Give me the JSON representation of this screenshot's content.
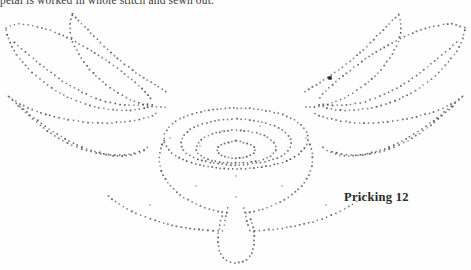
{
  "page": {
    "width": 471,
    "height": 270,
    "background_color": "#fefefe"
  },
  "caption": {
    "text": "petal is worked in whole stitch and sewn out.",
    "clipped": "true"
  },
  "figure": {
    "label": "Pricking 12",
    "dot_color": "#4a4a4a",
    "dot_size_px": 1.6
  },
  "diagram_data": {
    "type": "dotted-outline-pattern",
    "description": "Pin-prick pattern: two pairs of pointed leaf/wing shapes flanking a central concentric rose, with a narrow pendant petal below.",
    "marker_dot": {
      "x": 330,
      "y": 78,
      "note": "enlarged starting pin hole"
    },
    "paths": [
      {
        "name": "left-upper-outer-wing",
        "spacing": 4.2,
        "points": [
          [
            6,
            28
          ],
          [
            18,
            24
          ],
          [
            34,
            26
          ],
          [
            52,
            31
          ],
          [
            72,
            40
          ],
          [
            92,
            51
          ],
          [
            110,
            63
          ],
          [
            126,
            75
          ],
          [
            139,
            86
          ],
          [
            148,
            95
          ],
          [
            152,
            101
          ]
        ]
      },
      {
        "name": "left-upper-inner-wing",
        "spacing": 4.2,
        "points": [
          [
            6,
            30
          ],
          [
            9,
            40
          ],
          [
            15,
            52
          ],
          [
            26,
            66
          ],
          [
            41,
            80
          ],
          [
            58,
            92
          ],
          [
            77,
            101
          ],
          [
            96,
            107
          ],
          [
            115,
            110
          ],
          [
            133,
            110
          ],
          [
            148,
            107
          ],
          [
            155,
            103
          ]
        ]
      },
      {
        "name": "left-upper-wing-vein",
        "spacing": 4.4,
        "points": [
          [
            14,
            42
          ],
          [
            28,
            54
          ],
          [
            45,
            68
          ],
          [
            64,
            82
          ],
          [
            84,
            93
          ],
          [
            104,
            101
          ],
          [
            124,
            105
          ],
          [
            141,
            105
          ],
          [
            152,
            103
          ]
        ]
      },
      {
        "name": "left-lower-outer-wing",
        "spacing": 4.2,
        "points": [
          [
            8,
            96
          ],
          [
            20,
            104
          ],
          [
            38,
            112
          ],
          [
            60,
            118
          ],
          [
            84,
            122
          ],
          [
            108,
            123
          ],
          [
            130,
            121
          ],
          [
            148,
            117
          ],
          [
            158,
            113
          ]
        ]
      },
      {
        "name": "left-lower-inner-wing",
        "spacing": 4.3,
        "points": [
          [
            9,
            97
          ],
          [
            24,
            110
          ],
          [
            42,
            124
          ],
          [
            62,
            137
          ],
          [
            82,
            147
          ],
          [
            100,
            153
          ],
          [
            117,
            156
          ],
          [
            132,
            155
          ],
          [
            143,
            151
          ],
          [
            150,
            145
          ]
        ]
      },
      {
        "name": "left-lower-wing-vein",
        "spacing": 4.5,
        "points": [
          [
            18,
            106
          ],
          [
            34,
            120
          ],
          [
            52,
            134
          ],
          [
            72,
            145
          ],
          [
            92,
            152
          ],
          [
            112,
            155
          ],
          [
            130,
            154
          ],
          [
            143,
            150
          ]
        ]
      },
      {
        "name": "top-left-petal-outer",
        "spacing": 4.2,
        "points": [
          [
            72,
            14
          ],
          [
            80,
            22
          ],
          [
            92,
            34
          ],
          [
            106,
            48
          ],
          [
            122,
            62
          ],
          [
            138,
            74
          ],
          [
            152,
            83
          ],
          [
            162,
            89
          ],
          [
            168,
            93
          ]
        ]
      },
      {
        "name": "top-left-petal-inner",
        "spacing": 4.2,
        "points": [
          [
            72,
            15
          ],
          [
            70,
            26
          ],
          [
            72,
            40
          ],
          [
            80,
            56
          ],
          [
            92,
            72
          ],
          [
            108,
            86
          ],
          [
            125,
            97
          ],
          [
            142,
            104
          ],
          [
            156,
            107
          ],
          [
            166,
            107
          ]
        ]
      },
      {
        "name": "right-upper-outer-wing",
        "spacing": 4.2,
        "points": [
          [
            465,
            28
          ],
          [
            452,
            24
          ],
          [
            436,
            26
          ],
          [
            418,
            31
          ],
          [
            398,
            40
          ],
          [
            378,
            51
          ],
          [
            360,
            63
          ],
          [
            344,
            75
          ],
          [
            331,
            86
          ],
          [
            322,
            95
          ],
          [
            318,
            101
          ]
        ]
      },
      {
        "name": "right-upper-inner-wing",
        "spacing": 4.2,
        "points": [
          [
            465,
            30
          ],
          [
            462,
            40
          ],
          [
            456,
            52
          ],
          [
            445,
            66
          ],
          [
            430,
            80
          ],
          [
            413,
            92
          ],
          [
            394,
            101
          ],
          [
            375,
            107
          ],
          [
            356,
            110
          ],
          [
            338,
            110
          ],
          [
            323,
            107
          ],
          [
            316,
            103
          ]
        ]
      },
      {
        "name": "right-upper-wing-vein",
        "spacing": 4.4,
        "points": [
          [
            457,
            42
          ],
          [
            443,
            54
          ],
          [
            426,
            68
          ],
          [
            407,
            82
          ],
          [
            387,
            93
          ],
          [
            367,
            101
          ],
          [
            347,
            105
          ],
          [
            330,
            105
          ],
          [
            319,
            103
          ]
        ]
      },
      {
        "name": "right-lower-outer-wing",
        "spacing": 4.2,
        "points": [
          [
            463,
            96
          ],
          [
            451,
            104
          ],
          [
            433,
            112
          ],
          [
            411,
            118
          ],
          [
            387,
            122
          ],
          [
            363,
            123
          ],
          [
            341,
            121
          ],
          [
            323,
            117
          ],
          [
            313,
            113
          ]
        ]
      },
      {
        "name": "right-lower-inner-wing",
        "spacing": 4.3,
        "points": [
          [
            462,
            97
          ],
          [
            447,
            110
          ],
          [
            429,
            124
          ],
          [
            409,
            137
          ],
          [
            389,
            147
          ],
          [
            371,
            153
          ],
          [
            354,
            156
          ],
          [
            339,
            155
          ],
          [
            328,
            151
          ],
          [
            321,
            145
          ]
        ]
      },
      {
        "name": "right-lower-wing-vein",
        "spacing": 4.5,
        "points": [
          [
            453,
            106
          ],
          [
            437,
            120
          ],
          [
            419,
            134
          ],
          [
            399,
            145
          ],
          [
            379,
            152
          ],
          [
            359,
            155
          ],
          [
            341,
            154
          ],
          [
            328,
            150
          ]
        ]
      },
      {
        "name": "top-right-petal-outer",
        "spacing": 4.2,
        "points": [
          [
            399,
            14
          ],
          [
            391,
            22
          ],
          [
            379,
            34
          ],
          [
            365,
            48
          ],
          [
            349,
            62
          ],
          [
            333,
            74
          ],
          [
            319,
            83
          ],
          [
            309,
            89
          ],
          [
            303,
            93
          ]
        ]
      },
      {
        "name": "top-right-petal-inner",
        "spacing": 4.2,
        "points": [
          [
            399,
            15
          ],
          [
            401,
            26
          ],
          [
            399,
            40
          ],
          [
            391,
            56
          ],
          [
            379,
            72
          ],
          [
            363,
            86
          ],
          [
            346,
            97
          ],
          [
            329,
            104
          ],
          [
            315,
            107
          ],
          [
            305,
            107
          ]
        ]
      },
      {
        "name": "rose-outer-ring",
        "spacing": 4.0,
        "closed": true,
        "points": [
          [
            236,
            108
          ],
          [
            262,
            110
          ],
          [
            286,
            116
          ],
          [
            302,
            126
          ],
          [
            308,
            138
          ],
          [
            302,
            151
          ],
          [
            286,
            161
          ],
          [
            262,
            167
          ],
          [
            236,
            169
          ],
          [
            210,
            167
          ],
          [
            186,
            161
          ],
          [
            170,
            151
          ],
          [
            164,
            138
          ],
          [
            170,
            126
          ],
          [
            186,
            116
          ],
          [
            210,
            110
          ]
        ]
      },
      {
        "name": "rose-second-ring",
        "spacing": 3.9,
        "closed": true,
        "points": [
          [
            236,
            119
          ],
          [
            257,
            121
          ],
          [
            275,
            126
          ],
          [
            287,
            134
          ],
          [
            291,
            143
          ],
          [
            287,
            152
          ],
          [
            275,
            159
          ],
          [
            257,
            163
          ],
          [
            236,
            165
          ],
          [
            215,
            163
          ],
          [
            197,
            159
          ],
          [
            185,
            152
          ],
          [
            181,
            143
          ],
          [
            185,
            134
          ],
          [
            197,
            126
          ],
          [
            215,
            121
          ]
        ]
      },
      {
        "name": "rose-third-ring",
        "spacing": 3.8,
        "closed": true,
        "points": [
          [
            236,
            130
          ],
          [
            252,
            132
          ],
          [
            265,
            136
          ],
          [
            273,
            142
          ],
          [
            276,
            148
          ],
          [
            273,
            154
          ],
          [
            265,
            159
          ],
          [
            252,
            162
          ],
          [
            236,
            163
          ],
          [
            220,
            162
          ],
          [
            207,
            159
          ],
          [
            199,
            154
          ],
          [
            196,
            148
          ],
          [
            199,
            142
          ],
          [
            207,
            136
          ],
          [
            220,
            132
          ]
        ]
      },
      {
        "name": "rose-centre-ring",
        "spacing": 3.6,
        "closed": true,
        "points": [
          [
            236,
            141
          ],
          [
            246,
            143
          ],
          [
            253,
            146
          ],
          [
            255,
            150
          ],
          [
            253,
            154
          ],
          [
            246,
            157
          ],
          [
            236,
            158
          ],
          [
            226,
            157
          ],
          [
            219,
            154
          ],
          [
            217,
            150
          ],
          [
            219,
            146
          ],
          [
            226,
            143
          ]
        ]
      },
      {
        "name": "rose-skirt-left",
        "spacing": 4.2,
        "points": [
          [
            164,
            140
          ],
          [
            160,
            152
          ],
          [
            160,
            166
          ],
          [
            166,
            180
          ],
          [
            178,
            193
          ],
          [
            194,
            203
          ],
          [
            212,
            210
          ],
          [
            228,
            213
          ]
        ]
      },
      {
        "name": "rose-skirt-right",
        "spacing": 4.2,
        "points": [
          [
            308,
            140
          ],
          [
            312,
            152
          ],
          [
            312,
            166
          ],
          [
            306,
            180
          ],
          [
            294,
            193
          ],
          [
            278,
            203
          ],
          [
            260,
            210
          ],
          [
            244,
            213
          ]
        ]
      },
      {
        "name": "lower-outer-sweep-left",
        "spacing": 4.3,
        "points": [
          [
            108,
            196
          ],
          [
            122,
            206
          ],
          [
            140,
            215
          ],
          [
            160,
            222
          ],
          [
            182,
            227
          ],
          [
            204,
            230
          ],
          [
            226,
            231
          ]
        ]
      },
      {
        "name": "lower-outer-sweep-right",
        "spacing": 4.3,
        "points": [
          [
            364,
            196
          ],
          [
            350,
            206
          ],
          [
            332,
            215
          ],
          [
            312,
            222
          ],
          [
            290,
            227
          ],
          [
            268,
            230
          ],
          [
            246,
            231
          ]
        ]
      },
      {
        "name": "pendant-petal",
        "spacing": 4.0,
        "closed": false,
        "points": [
          [
            222,
            216
          ],
          [
            219,
            228
          ],
          [
            218,
            240
          ],
          [
            220,
            252
          ],
          [
            226,
            260
          ],
          [
            236,
            263
          ],
          [
            246,
            260
          ],
          [
            252,
            252
          ],
          [
            254,
            240
          ],
          [
            253,
            228
          ],
          [
            250,
            216
          ]
        ]
      },
      {
        "name": "pendant-petal-stem-left",
        "spacing": 4.2,
        "points": [
          [
            228,
            208
          ],
          [
            226,
            216
          ],
          [
            224,
            226
          ]
        ]
      },
      {
        "name": "pendant-petal-stem-right",
        "spacing": 4.2,
        "points": [
          [
            244,
            208
          ],
          [
            246,
            216
          ],
          [
            248,
            226
          ]
        ]
      }
    ],
    "scatter_dots": [
      [
        222,
        131
      ],
      [
        260,
        126
      ],
      [
        200,
        146
      ],
      [
        276,
        151
      ],
      [
        236,
        176
      ],
      [
        196,
        186
      ],
      [
        282,
        186
      ],
      [
        150,
        205
      ],
      [
        326,
        205
      ],
      [
        236,
        197
      ],
      [
        170,
        138
      ],
      [
        306,
        138
      ]
    ]
  }
}
